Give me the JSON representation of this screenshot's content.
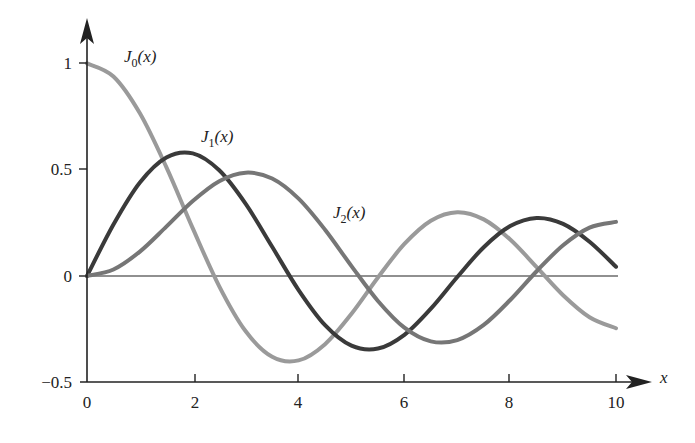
{
  "chart_data": {
    "type": "line",
    "title": "",
    "xlabel": "x",
    "ylabel": "",
    "xlim": [
      0,
      10
    ],
    "ylim": [
      -0.5,
      1
    ],
    "grid": false,
    "x_ticks": [
      "0",
      "2",
      "4",
      "6",
      "8",
      "10"
    ],
    "y_ticks": [
      "-0.5",
      "0",
      "0.5",
      "1"
    ],
    "x": [
      0,
      0.5,
      1,
      1.5,
      2,
      2.5,
      3,
      3.5,
      4,
      4.5,
      5,
      5.5,
      6,
      6.5,
      7,
      7.5,
      8,
      8.5,
      9,
      9.5,
      10
    ],
    "series": [
      {
        "name": "J0(x)",
        "color": "#9a9a9a",
        "values": [
          1.0,
          0.9385,
          0.7652,
          0.5118,
          0.2239,
          -0.0484,
          -0.2601,
          -0.3801,
          -0.3971,
          -0.3205,
          -0.1776,
          -0.0068,
          0.1506,
          0.2601,
          0.3001,
          0.2663,
          0.1717,
          0.0419,
          -0.0903,
          -0.1939,
          -0.2459
        ]
      },
      {
        "name": "J1(x)",
        "color": "#3a3a3a",
        "values": [
          0.0,
          0.2423,
          0.4401,
          0.5579,
          0.5767,
          0.4971,
          0.3391,
          0.1374,
          -0.066,
          -0.2311,
          -0.3276,
          -0.3414,
          -0.2767,
          -0.1538,
          -0.0047,
          0.1352,
          0.2346,
          0.2731,
          0.2453,
          0.1613,
          0.0435
        ]
      },
      {
        "name": "J2(x)",
        "color": "#767676",
        "values": [
          0.0,
          0.0306,
          0.1149,
          0.2321,
          0.3528,
          0.4461,
          0.4861,
          0.4586,
          0.3641,
          0.2178,
          0.0466,
          -0.1173,
          -0.2429,
          -0.3074,
          -0.3014,
          -0.2303,
          -0.113,
          0.0223,
          0.1448,
          0.2279,
          0.2546
        ]
      }
    ],
    "annotations": [
      {
        "text": "J0(x)",
        "at": [
          1.0,
          1.07
        ]
      },
      {
        "text": "J1(x)",
        "at": [
          2.3,
          0.62
        ]
      },
      {
        "text": "J2(x)",
        "at": [
          4.6,
          0.27
        ]
      }
    ]
  },
  "labels": {
    "x_axis": "x",
    "y1": "1",
    "y05": "0.5",
    "y0": "0",
    "ym05": "−0.5",
    "x0": "0",
    "x2": "2",
    "x4": "4",
    "x6": "6",
    "x8": "8",
    "x10": "10",
    "j0_main": "J",
    "j0_sub": "0",
    "j0_arg": "(x)",
    "j1_main": "J",
    "j1_sub": "1",
    "j1_arg": "(x)",
    "j2_main": "J",
    "j2_sub": "2",
    "j2_arg": "(x)"
  }
}
